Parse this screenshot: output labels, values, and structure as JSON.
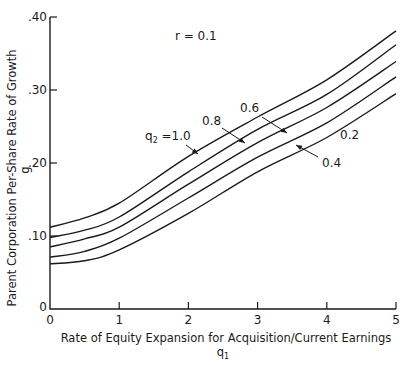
{
  "chart_data": {
    "type": "line",
    "title": "",
    "annotation_top": "r = 0.1",
    "xlabel": "Rate of Equity Expansion for Acquisition/Current Earnings",
    "xlabel_symbol": "q",
    "xlabel_symbol_sub": "1",
    "ylabel": "Parent Corporation Per-Share Rate of Growth",
    "ylabel_symbol": "g",
    "xlim": [
      0,
      5
    ],
    "ylim": [
      0,
      0.4
    ],
    "x_ticks": [
      0,
      1,
      2,
      3,
      4,
      5
    ],
    "x_tick_labels": [
      "0",
      "1",
      "2",
      "3",
      "4",
      "5"
    ],
    "y_ticks": [
      0,
      0.1,
      0.2,
      0.3,
      0.4
    ],
    "y_tick_labels": [
      "0",
      ".10",
      ".20",
      ".30",
      ".40"
    ],
    "grid": false,
    "legend": "inline labels with arrows",
    "x": [
      0,
      0.5,
      1,
      2,
      3,
      4,
      5
    ],
    "series": [
      {
        "name": "q2 = 1.0",
        "label": "1.0",
        "values": [
          0.112,
          0.125,
          0.145,
          0.209,
          0.263,
          0.314,
          0.381
        ]
      },
      {
        "name": "q2 = 0.8",
        "label": "0.8",
        "values": [
          0.098,
          0.108,
          0.126,
          0.188,
          0.246,
          0.294,
          0.362
        ]
      },
      {
        "name": "q2 = 0.6",
        "label": "0.6",
        "values": [
          0.085,
          0.096,
          0.112,
          0.171,
          0.228,
          0.276,
          0.339
        ]
      },
      {
        "name": "q2 = 0.4",
        "label": "0.4",
        "values": [
          0.071,
          0.079,
          0.097,
          0.152,
          0.208,
          0.255,
          0.318
        ]
      },
      {
        "name": "q2 = 0.2",
        "label": "0.2",
        "values": [
          0.062,
          0.066,
          0.081,
          0.131,
          0.188,
          0.235,
          0.295
        ]
      }
    ],
    "series_annotations": [
      {
        "text_prefix": "q",
        "text_sub": "2",
        "text_suffix": " =1.0",
        "text_x": 145,
        "text_y": 140,
        "arrow_from": [
          186,
          145
        ],
        "arrow_to": [
          198,
          154
        ]
      },
      {
        "text": "0.8",
        "text_x": 202,
        "text_y": 125,
        "arrow_from": [
          222,
          128
        ],
        "arrow_to": [
          245,
          143
        ]
      },
      {
        "text": "0.6",
        "text_x": 240,
        "text_y": 112,
        "arrow_from": [
          262,
          117
        ],
        "arrow_to": [
          287,
          133
        ]
      },
      {
        "text": "0.4",
        "text_x": 322,
        "text_y": 167,
        "arrow_from": [
          318,
          157
        ],
        "arrow_to": [
          296,
          145
        ]
      },
      {
        "text": "0.2",
        "text_x": 340,
        "text_y": 139,
        "arrow_from": null,
        "arrow_to": null
      }
    ]
  }
}
